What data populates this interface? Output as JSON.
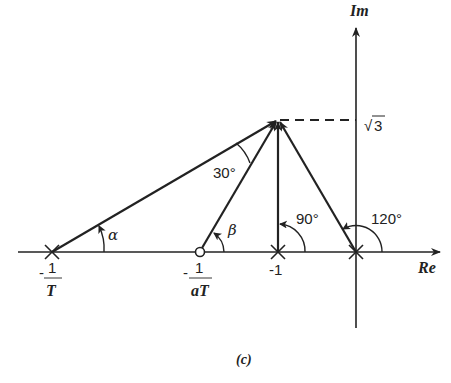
{
  "figure": {
    "caption": "(c)",
    "axes": {
      "real_label": "Re",
      "imag_label": "Im"
    },
    "imag_marker": {
      "label": "√3",
      "sqrt": "√",
      "value": "3"
    },
    "poles_zeros": [
      {
        "type": "pole",
        "label_num": "1",
        "label_den": "T",
        "sign": "-"
      },
      {
        "type": "zero",
        "label_num": "1",
        "label_den": "aT",
        "sign": "-"
      },
      {
        "type": "pole",
        "label": "-1"
      },
      {
        "type": "pole",
        "label": "0"
      }
    ],
    "angles": {
      "alpha": "α",
      "beta": "β",
      "angle_30": "30°",
      "angle_90": "90°",
      "angle_120": "120°"
    }
  }
}
